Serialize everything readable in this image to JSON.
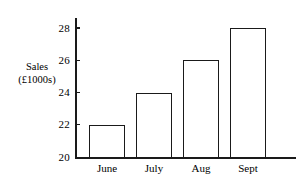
{
  "chart_data": {
    "type": "bar",
    "title": "",
    "xlabel": "",
    "ylabel": "Sales (£1000s)",
    "ylabel_lines": [
      "Sales",
      "(£1000s)"
    ],
    "categories": [
      "June",
      "July",
      "Aug",
      "Sept"
    ],
    "values": [
      22,
      24,
      26,
      28
    ],
    "ylim": [
      20,
      28
    ],
    "yticks": [
      20,
      22,
      24,
      26,
      28
    ],
    "ytick_labels": [
      "20",
      "22",
      "24",
      "26",
      "28"
    ],
    "grid": false,
    "legend": false,
    "bar_style": {
      "fill": "#ffffff",
      "edge": "#1a1a1a"
    }
  },
  "axis": {
    "line_color": "#1a1a1a"
  }
}
